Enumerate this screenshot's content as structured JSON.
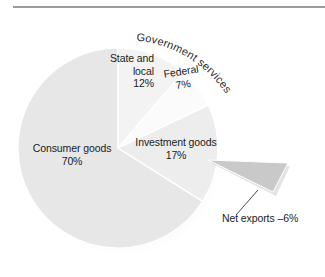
{
  "figure": {
    "background_color": "#ffffff",
    "rule_color": "#9a9a9a"
  },
  "chart_data": {
    "type": "pie",
    "title": "",
    "subtitle": "",
    "xlabel": "",
    "ylabel": "",
    "legend_position": "none",
    "grid": false,
    "exploded_slice": "Net exports",
    "group_annotation": "Government services",
    "categories": [
      "State and local",
      "Federal",
      "Investment goods",
      "Consumer goods",
      "Net exports"
    ],
    "values": [
      12,
      7,
      17,
      70,
      -6
    ],
    "slices": [
      {
        "name": "State and local",
        "label_line1": "State and",
        "label_line2": "local",
        "value_label": "12%",
        "value": 12,
        "color": "#f3f3f3",
        "exploded": false
      },
      {
        "name": "Federal",
        "label_line1": "Federal",
        "label_line2": "",
        "value_label": "7%",
        "value": 7,
        "color": "#fbfbfb",
        "exploded": false
      },
      {
        "name": "Investment goods",
        "label_line1": "Investment goods",
        "label_line2": "",
        "value_label": "17%",
        "value": 17,
        "color": "#ededed",
        "exploded": false
      },
      {
        "name": "Consumer goods",
        "label_line1": "Consumer goods",
        "label_line2": "",
        "value_label": "70%",
        "value": 70,
        "color": "#e7e7e7",
        "exploded": false
      },
      {
        "name": "Net exports",
        "label_line1": "Net exports –6%",
        "label_line2": "",
        "value_label": "–6%",
        "value": -6,
        "color": "#c9c9c9",
        "exploded": true
      }
    ],
    "annotations": [
      {
        "text": "Government services",
        "style": "curved-arc"
      },
      {
        "text": "Net exports –6%",
        "style": "leader-line"
      }
    ]
  },
  "labels": {
    "government_services": "Government services",
    "state_and_local_line1": "State and",
    "state_and_local_line2": "local",
    "state_and_local_value": "12%",
    "federal_name": "Federal",
    "federal_value": "7%",
    "investment_goods_name": "Investment goods",
    "investment_goods_value": "17%",
    "consumer_goods_name": "Consumer goods",
    "consumer_goods_value": "70%",
    "net_exports": "Net exports –6%"
  }
}
